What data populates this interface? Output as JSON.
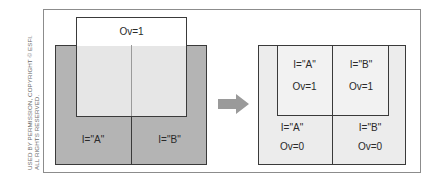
{
  "credit": "USED BY PERMISSION, COPYRIGHT © ESFI. ALL RIGHTS RESERVED.",
  "colors": {
    "dark_fill": "#b4b4b4",
    "overlay_fill": "#e6e6e6",
    "light_fill": "#ececec",
    "white": "#ffffff",
    "border": "#3a3a3a",
    "arrow": "#9a9a9a"
  },
  "before": {
    "overlay_label": "Ov=1",
    "cells": [
      {
        "label": "I=\"A\""
      },
      {
        "label": "I=\"B\""
      }
    ]
  },
  "arrow": {
    "icon": "right-arrow-icon"
  },
  "after": {
    "cells": [
      {
        "interlock": "I=\"A\"",
        "ov": "Ov=1"
      },
      {
        "interlock": "I=\"B\"",
        "ov": "Ov=1"
      },
      {
        "interlock": "I=\"A\"",
        "ov": "Ov=0"
      },
      {
        "interlock": "I=\"B\"",
        "ov": "Ov=0"
      }
    ]
  }
}
